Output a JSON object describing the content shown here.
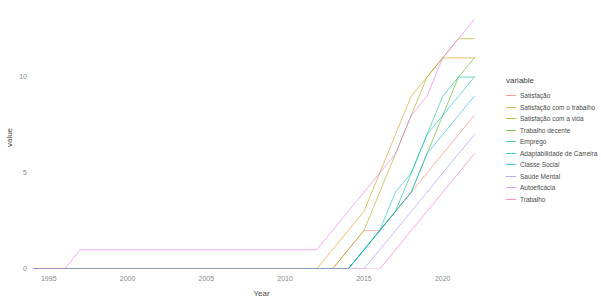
{
  "chart_data": {
    "type": "line",
    "title": "",
    "xlabel": "Year",
    "ylabel": "value",
    "xlim": [
      1994,
      2023
    ],
    "ylim": [
      0,
      13.6
    ],
    "xticks": [
      1995,
      2000,
      2005,
      2010,
      2015,
      2020
    ],
    "yticks": [
      0,
      5,
      10
    ],
    "grid": false,
    "step_like": true,
    "legend_position": "right",
    "legend_title": "variable",
    "series": [
      {
        "name": "Satisfação",
        "color": "#F8766D",
        "x": [
          1994,
          2013,
          2014,
          2015,
          2016,
          2017,
          2018,
          2019,
          2020,
          2021,
          2022
        ],
        "y": [
          0,
          0,
          1,
          2,
          2,
          3,
          4,
          5,
          6,
          7,
          8
        ]
      },
      {
        "name": "Satisfação com o trabalho",
        "color": "#D89000",
        "x": [
          1994,
          2012,
          2013,
          2014,
          2015,
          2016,
          2017,
          2018,
          2019,
          2020,
          2021,
          2022
        ],
        "y": [
          0,
          0,
          1,
          2,
          3,
          5,
          7,
          9,
          10,
          11,
          11,
          11
        ]
      },
      {
        "name": "Satisfação com a vida",
        "color": "#A3A500",
        "x": [
          1994,
          2013,
          2014,
          2015,
          2016,
          2017,
          2018,
          2019,
          2020,
          2021,
          2022
        ],
        "y": [
          0,
          0,
          1,
          2,
          4,
          6,
          8,
          10,
          11,
          12,
          12
        ]
      },
      {
        "name": "Trabalho decente",
        "color": "#39B600",
        "x": [
          1994,
          2014,
          2015,
          2016,
          2017,
          2018,
          2019,
          2020,
          2021,
          2022
        ],
        "y": [
          0,
          0,
          1,
          2,
          3,
          4,
          6,
          8,
          10,
          11
        ]
      },
      {
        "name": "Emprego",
        "color": "#00BF7D",
        "x": [
          1994,
          2014,
          2015,
          2016,
          2017,
          2018,
          2019,
          2020,
          2021,
          2022
        ],
        "y": [
          0,
          0,
          1,
          2,
          3,
          5,
          7,
          9,
          10,
          10
        ]
      },
      {
        "name": "Adaptabilidade de Carreira",
        "color": "#00BFC4",
        "x": [
          1994,
          2014,
          2015,
          2016,
          2017,
          2018,
          2019,
          2020,
          2021,
          2022
        ],
        "y": [
          0,
          0,
          1,
          2,
          4,
          5,
          7,
          8,
          9,
          10
        ]
      },
      {
        "name": "Classe Social",
        "color": "#00B0F6",
        "x": [
          1994,
          2014,
          2015,
          2016,
          2017,
          2018,
          2019,
          2020,
          2021,
          2022
        ],
        "y": [
          0,
          0,
          1,
          2,
          3,
          4,
          6,
          7,
          8,
          9
        ]
      },
      {
        "name": "Saúde Mental",
        "color": "#9590FF",
        "x": [
          1994,
          2015,
          2016,
          2017,
          2018,
          2019,
          2020,
          2021,
          2022
        ],
        "y": [
          0,
          0,
          1,
          2,
          3,
          4,
          5,
          6,
          7
        ]
      },
      {
        "name": "Autoeficácia",
        "color": "#E76BF3",
        "x": [
          1994,
          1996,
          1997,
          2012,
          2013,
          2014,
          2015,
          2016,
          2017,
          2018,
          2019,
          2020,
          2021,
          2022
        ],
        "y": [
          0,
          0,
          1,
          1,
          2,
          3,
          4,
          5,
          6,
          8,
          9,
          11,
          12,
          13
        ]
      },
      {
        "name": "Trabalho",
        "color": "#FF62BC",
        "x": [
          1994,
          2016,
          2017,
          2018,
          2019,
          2020,
          2021,
          2022
        ],
        "y": [
          0,
          0,
          1,
          2,
          3,
          4,
          5,
          6
        ]
      }
    ]
  },
  "axes": {
    "x_title": "Year",
    "y_title": "value",
    "x_tick_labels": [
      "1995",
      "2000",
      "2005",
      "2010",
      "2015",
      "2020"
    ],
    "y_tick_labels": [
      "0",
      "5",
      "10"
    ]
  },
  "legend": {
    "title": "variable",
    "items": [
      {
        "label": "Satisfação",
        "color": "#F8766D"
      },
      {
        "label": "Satisfação com o trabalho",
        "color": "#D89000"
      },
      {
        "label": "Satisfação com a vida",
        "color": "#A3A500"
      },
      {
        "label": "Trabalho decente",
        "color": "#39B600"
      },
      {
        "label": "Emprego",
        "color": "#00BF7D"
      },
      {
        "label": "Adaptabilidade de Carreira",
        "color": "#00BFC4"
      },
      {
        "label": "Classe Social",
        "color": "#00B0F6"
      },
      {
        "label": "Saúde Mental",
        "color": "#9590FF"
      },
      {
        "label": "Autoeficácia",
        "color": "#E76BF3"
      },
      {
        "label": "Trabalho",
        "color": "#FF62BC"
      }
    ]
  }
}
